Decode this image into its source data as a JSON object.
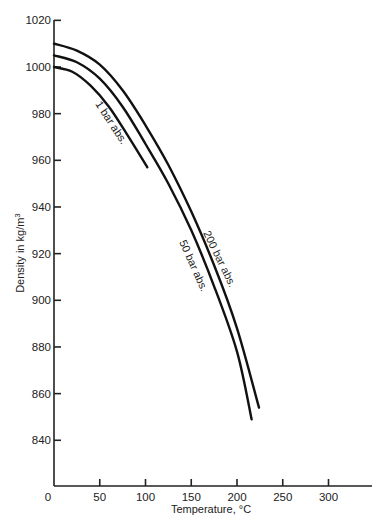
{
  "chart_data": {
    "type": "line",
    "title": "",
    "xlabel": "Temperature, °C",
    "ylabel": "Density in kg/m³",
    "ylabel_main": "Density in kg/m",
    "ylabel_sup": "3",
    "xlim": [
      0,
      350
    ],
    "ylim": [
      820,
      1020
    ],
    "grid": false,
    "legend": "inline curve labels",
    "x_ticks": [
      0,
      50,
      100,
      150,
      200,
      250,
      300
    ],
    "y_ticks": [
      840,
      860,
      880,
      900,
      920,
      940,
      960,
      980,
      1000,
      1020
    ],
    "series": [
      {
        "name": "1 bar abs.",
        "x": [
          0,
          20,
          40,
          60,
          80,
          102
        ],
        "y": [
          1000,
          998,
          992,
          983,
          971,
          957
        ]
      },
      {
        "name": "50 bar abs.",
        "x": [
          0,
          25,
          50,
          75,
          100,
          125,
          150,
          175,
          200,
          216
        ],
        "y": [
          1005,
          1002,
          995,
          983,
          967,
          950,
          930,
          906,
          878,
          849
        ]
      },
      {
        "name": "200 bar abs.",
        "x": [
          0,
          25,
          50,
          75,
          100,
          125,
          150,
          175,
          200,
          224
        ],
        "y": [
          1010,
          1007,
          1001,
          990,
          975,
          958,
          938,
          915,
          888,
          854
        ]
      }
    ]
  }
}
